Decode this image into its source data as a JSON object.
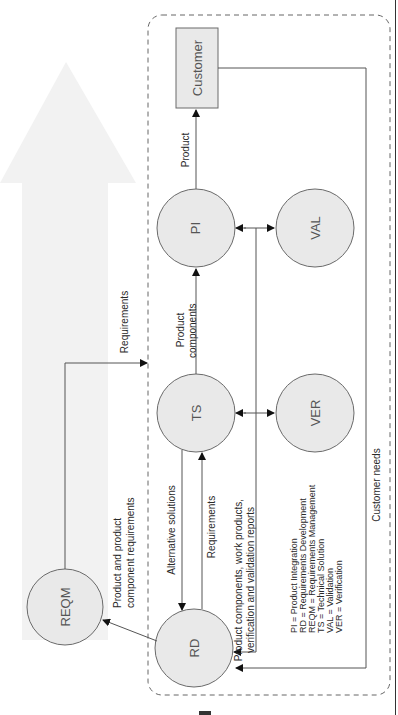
{
  "diagram": {
    "nodes": {
      "customer": {
        "label": "Customer",
        "shape": "rect"
      },
      "pi": {
        "label": "PI",
        "shape": "circle"
      },
      "val": {
        "label": "VAL",
        "shape": "circle"
      },
      "ts": {
        "label": "TS",
        "shape": "circle"
      },
      "ver": {
        "label": "VER",
        "shape": "circle"
      },
      "reqm": {
        "label": "REQM",
        "shape": "circle"
      },
      "rd": {
        "label": "RD",
        "shape": "circle"
      }
    },
    "edges": {
      "pi_to_customer": "Product",
      "ts_to_pi_line1": "Product",
      "ts_to_pi_line2": "components",
      "reqm_requirements": "Requirements",
      "rd_to_reqm_line1": "Product and product",
      "rd_to_reqm_line2": "component requirements",
      "ts_to_rd": "Alternative solutions",
      "rd_to_ts": "Requirements",
      "feedback_line1": "Product components, work products,",
      "feedback_line2": "verification and validation reports",
      "customer_needs": "Customer needs"
    },
    "legend": [
      "PI = Product Integration",
      "RD = Requirements Development",
      "REQM = Requirements Management",
      "TS = Technical Solution",
      "VAL = Validation",
      "VER = Verification"
    ],
    "colors": {
      "node_fill": "#e9e9e9",
      "node_stroke": "#6a6a6a",
      "arrow_bg": "#f2f2f2",
      "line": "#555555"
    }
  }
}
